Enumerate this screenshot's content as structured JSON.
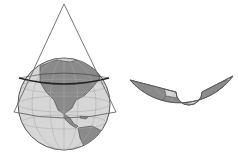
{
  "figure": {
    "colors": {
      "background": "#ffffff",
      "ocean": "#d4d4d4",
      "land": "#8a8a8a",
      "outline": "#555555",
      "graticule": "#a8a8a8",
      "tangent_line": "#222222"
    }
  }
}
